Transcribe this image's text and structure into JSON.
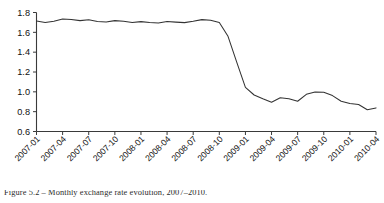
{
  "chart_data": {
    "type": "line",
    "title": "",
    "subtitle": "",
    "xlabel": "",
    "ylabel": "",
    "grid": false,
    "legend": false,
    "legend_position": "none",
    "line_color": "#333333",
    "background_color": "#ffffff",
    "axis_color": "#3a3a3a",
    "ylim": [
      0.6,
      1.8
    ],
    "ytick_labels": [
      "1.8",
      "1.6",
      "1.4",
      "1.2",
      "1.0",
      "0.8",
      "0.6"
    ],
    "ytick_values": [
      1.8,
      1.6,
      1.4,
      1.2,
      1.0,
      0.8,
      0.6
    ],
    "xtick_labels": [
      "2007-01",
      "2007-04",
      "2007-07",
      "2007-10",
      "2008-01",
      "2008-04",
      "2008-07",
      "2008-10",
      "2009-01",
      "2009-04",
      "2009-07",
      "2009-10",
      "2010-01",
      "2010-04"
    ],
    "xtick_rotation": 45,
    "x": [
      "2007-01",
      "2007-02",
      "2007-03",
      "2007-04",
      "2007-05",
      "2007-06",
      "2007-07",
      "2007-08",
      "2007-09",
      "2007-10",
      "2007-11",
      "2007-12",
      "2008-01",
      "2008-02",
      "2008-03",
      "2008-04",
      "2008-05",
      "2008-06",
      "2008-07",
      "2008-08",
      "2008-09",
      "2008-10",
      "2008-11",
      "2008-12",
      "2009-01",
      "2009-02",
      "2009-03",
      "2009-04",
      "2009-05",
      "2009-06",
      "2009-07",
      "2009-08",
      "2009-09",
      "2009-10",
      "2009-11",
      "2009-12",
      "2010-01",
      "2010-02",
      "2010-03",
      "2010-04"
    ],
    "values": [
      1.715,
      1.7,
      1.712,
      1.735,
      1.73,
      1.718,
      1.726,
      1.71,
      1.705,
      1.718,
      1.712,
      1.7,
      1.708,
      1.7,
      1.695,
      1.71,
      1.703,
      1.698,
      1.712,
      1.728,
      1.722,
      1.7,
      1.56,
      1.3,
      1.045,
      0.968,
      0.93,
      0.895,
      0.94,
      0.93,
      0.905,
      0.975,
      0.998,
      0.995,
      0.962,
      0.905,
      0.882,
      0.872,
      0.82,
      0.838
    ],
    "annotations": []
  },
  "caption": {
    "text": "Figure 5.2 – Monthly exchange rate evolution, 2007–2010."
  }
}
